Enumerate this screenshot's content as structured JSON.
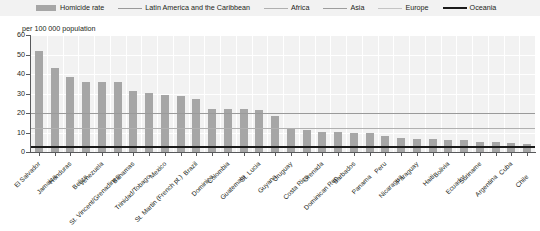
{
  "axis_title": "per 100 000 population",
  "legend": {
    "items": [
      {
        "label": "Homicide rate",
        "type": "bar",
        "color": "#a6a6a6",
        "width": 0
      },
      {
        "label": "Latin America and the Caribbean",
        "type": "line",
        "color": "#9a9a9a",
        "width": 1.5
      },
      {
        "label": "Africa",
        "type": "line",
        "color": "#b0b0b0",
        "width": 1.2
      },
      {
        "label": "Asia",
        "type": "line",
        "color": "#9d9d9d",
        "width": 1.2
      },
      {
        "label": "Europe",
        "type": "line",
        "color": "#c4c4c4",
        "width": 1.2
      },
      {
        "label": "Oceania",
        "type": "line",
        "color": "#1a1a1a",
        "width": 2.2
      }
    ]
  },
  "chart_data": {
    "type": "bar",
    "title": "",
    "subtitle": "",
    "xlabel": "",
    "ylabel": "per 100 000 population",
    "ylim": [
      0,
      60
    ],
    "yticks": [
      0,
      10,
      20,
      30,
      40,
      50,
      60
    ],
    "ytick_labels": [
      "0",
      "10",
      "20",
      "30",
      "40",
      "50",
      "60"
    ],
    "grid": true,
    "legend_position": "top",
    "bar_color": "#a6a6a6",
    "categories": [
      "El Salvador",
      "Jamaica",
      "Honduras",
      "Belize",
      "Venezuela",
      "St. Vincent/Grenadines",
      "Bahamas",
      "Trinidad/Tobago",
      "Mexico",
      "St. Martin (French pt.)",
      "Brazil",
      "Dominica",
      "Colombia",
      "Guatemala",
      "St. Lucia",
      "Guyana",
      "Uruguay",
      "Costa Rica",
      "Grenada",
      "Dominican Rep.",
      "Barbados",
      "Panama",
      "Peru",
      "Nicaragua",
      "Paraguay",
      "Haiti",
      "Bolivia",
      "Ecuador",
      "Suriname",
      "Argentina",
      "Cuba",
      "Chile"
    ],
    "values": [
      52.0,
      43.2,
      38.4,
      36.0,
      36.0,
      36.0,
      31.5,
      30.5,
      29.0,
      28.5,
      27.0,
      22.0,
      22.0,
      22.0,
      21.5,
      18.5,
      11.8,
      11.4,
      10.5,
      10.3,
      10.0,
      9.8,
      8.0,
      7.0,
      6.8,
      6.5,
      6.3,
      6.0,
      5.0,
      5.0,
      4.8,
      4.2
    ],
    "reference_lines": [
      {
        "name": "Latin America and the Caribbean",
        "value": 20.0,
        "color": "#9a9a9a",
        "width": 1.5
      },
      {
        "name": "Africa",
        "value": 12.5,
        "color": "#b0b0b0",
        "width": 1.2
      },
      {
        "name": "Asia",
        "value": 2.9,
        "color": "#9d9d9d",
        "width": 1.2
      },
      {
        "name": "Europe",
        "value": 3.0,
        "color": "#c4c4c4",
        "width": 1.2
      },
      {
        "name": "Oceania",
        "value": 3.0,
        "color": "#1a1a1a",
        "width": 2.2
      }
    ]
  }
}
